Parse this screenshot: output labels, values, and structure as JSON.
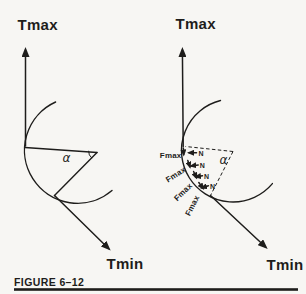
{
  "figure": {
    "caption": "FIGURE 6–12",
    "colors": {
      "ink": "#1e1d1b",
      "paper": "#f7f6f3"
    },
    "left": {
      "tmax": "Tmax",
      "tmin": "Tmin",
      "alpha": "α"
    },
    "right": {
      "tmax": "Tmax",
      "tmin": "Tmin",
      "alpha": "α",
      "fmax": [
        "Fmax",
        "Fmax",
        "Fmax",
        "Fmax"
      ],
      "n": [
        "N",
        "N",
        "N",
        "N"
      ]
    }
  }
}
